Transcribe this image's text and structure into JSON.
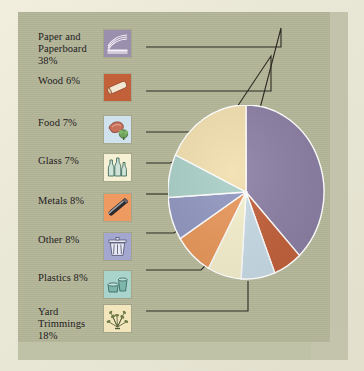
{
  "figure": {
    "background_color": "#b2b497",
    "mat_color": "#ece9d9",
    "leader_line_color": "#2c2a22"
  },
  "chart_data": {
    "type": "pie",
    "title": "",
    "categories": [
      "Paper and Paperboard",
      "Wood",
      "Food",
      "Glass",
      "Metals",
      "Other",
      "Plastics",
      "Yard Trimmings"
    ],
    "values": [
      38,
      6,
      7,
      7,
      8,
      8,
      8,
      18
    ],
    "value_unit": "%",
    "colors": [
      "#8b7fa3",
      "#c2603a",
      "#c8dbe6",
      "#f5f0cd",
      "#e8975a",
      "#9096c0",
      "#a9cfc7",
      "#f2dfae"
    ],
    "legend_position": "left",
    "slice_separator_color": "#ffffff",
    "xlabel": "",
    "ylabel": ""
  },
  "legend": {
    "items": [
      {
        "label": "Paper and Paperboard 38%",
        "name": "Paper and Paperboard",
        "percent": "38%",
        "icon": "paper-stack-icon",
        "icon_bg": "#9b8fae",
        "swatch_color": "#8b7fa3"
      },
      {
        "label": "Wood 6%",
        "name": "Wood",
        "percent": "6%",
        "icon": "wood-log-icon",
        "icon_bg": "#c2603a",
        "swatch_color": "#c2603a"
      },
      {
        "label": "Food 7%",
        "name": "Food",
        "percent": "7%",
        "icon": "food-icon",
        "icon_bg": "#cfe2ee",
        "swatch_color": "#c8dbe6"
      },
      {
        "label": "Glass 7%",
        "name": "Glass",
        "percent": "7%",
        "icon": "glass-bottles-icon",
        "icon_bg": "#f6f1d4",
        "swatch_color": "#f5f0cd"
      },
      {
        "label": "Metals 8%",
        "name": "Metals",
        "percent": "8%",
        "icon": "metal-pipe-icon",
        "icon_bg": "#ef9a60",
        "swatch_color": "#e8975a"
      },
      {
        "label": "Other 8%",
        "name": "Other",
        "percent": "8%",
        "icon": "trash-can-icon",
        "icon_bg": "#a3a7cf",
        "swatch_color": "#9096c0"
      },
      {
        "label": "Plastics 8%",
        "name": "Plastics",
        "percent": "8%",
        "icon": "plastic-container-icon",
        "icon_bg": "#a9d4cb",
        "swatch_color": "#a9cfc7"
      },
      {
        "label": "Yard Trimmings 18%",
        "name": "Yard Trimmings",
        "percent": "18%",
        "icon": "yard-trimmings-icon",
        "icon_bg": "#f3e6bd",
        "swatch_color": "#f2dfae"
      }
    ]
  }
}
